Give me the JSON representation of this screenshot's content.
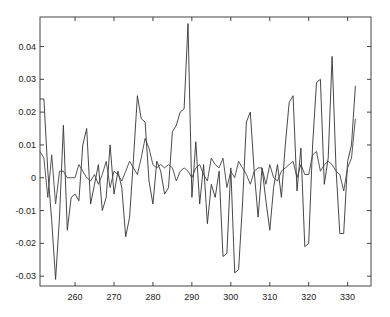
{
  "chart_data": {
    "type": "line",
    "title": "",
    "xlabel": "",
    "ylabel": "",
    "xlim": [
      251,
      336
    ],
    "ylim": [
      -0.033,
      0.049
    ],
    "grid": false,
    "legend": null,
    "x_ticks": [
      260,
      270,
      280,
      290,
      300,
      310,
      320,
      330
    ],
    "x_tick_labels": [
      "260",
      "270",
      "280",
      "290",
      "300",
      "310",
      "320",
      "330"
    ],
    "y_ticks": [
      -0.03,
      -0.02,
      -0.01,
      0,
      0.01,
      0.02,
      0.03,
      0.04
    ],
    "y_tick_labels": [
      "-0.03",
      "-0.02",
      "-0.01",
      "0",
      "0.01",
      "0.02",
      "0.03",
      "0.04"
    ],
    "x": [
      251,
      252,
      253,
      254,
      255,
      256,
      257,
      258,
      259,
      260,
      261,
      262,
      263,
      264,
      265,
      266,
      267,
      268,
      269,
      270,
      271,
      272,
      273,
      274,
      275,
      276,
      277,
      278,
      279,
      280,
      281,
      282,
      283,
      284,
      285,
      286,
      287,
      288,
      289,
      290,
      291,
      292,
      293,
      294,
      295,
      296,
      297,
      298,
      299,
      300,
      301,
      302,
      303,
      304,
      305,
      306,
      307,
      308,
      309,
      310,
      311,
      312,
      313,
      314,
      315,
      316,
      317,
      318,
      319,
      320,
      321,
      322,
      323,
      324,
      325,
      326,
      327,
      328,
      329,
      330,
      331,
      332
    ],
    "series": [
      {
        "name": "series-a",
        "color": "#333333",
        "values": [
          0.024,
          0.024,
          0.002,
          -0.013,
          -0.031,
          -0.012,
          0.016,
          -0.016,
          -0.006,
          -0.005,
          -0.007,
          0.01,
          0.015,
          -0.008,
          -0.002,
          0.004,
          -0.01,
          -0.006,
          0.01,
          -0.005,
          0.002,
          -0.003,
          -0.018,
          -0.012,
          0.006,
          0.025,
          0.018,
          0.017,
          -0.001,
          -0.008,
          0.005,
          0.002,
          -0.005,
          -0.003,
          0.014,
          0.016,
          0.02,
          0.021,
          0.047,
          -0.006,
          0.011,
          -0.008,
          0.004,
          -0.014,
          -0.002,
          -0.006,
          0.002,
          -0.024,
          -0.023,
          0.003,
          -0.029,
          -0.028,
          -0.008,
          0.017,
          0.02,
          0.002,
          -0.012,
          0.003,
          -0.007,
          -0.016,
          -0.003,
          0.004,
          -0.006,
          0.01,
          0.023,
          0.025,
          -0.004,
          0.009,
          -0.021,
          -0.02,
          0.01,
          0.029,
          0.03,
          -0.002,
          0.006,
          0.037,
          0.003,
          -0.017,
          -0.017,
          0.005,
          0.01,
          0.028
        ]
      },
      {
        "name": "series-b",
        "color": "#444444",
        "values": [
          0.008,
          0.006,
          -0.006,
          0.007,
          -0.008,
          0.002,
          0.002,
          0.0,
          0.0,
          0.0,
          0.004,
          0.002,
          0.0,
          -0.001,
          0.001,
          -0.002,
          0.001,
          0.005,
          -0.003,
          0.002,
          0.001,
          -0.001,
          0.002,
          0.005,
          0.003,
          0.001,
          0.006,
          0.012,
          0.009,
          0.004,
          0.003,
          0.004,
          0.003,
          0.004,
          0.003,
          -0.001,
          0.002,
          0.003,
          0.002,
          0.0,
          0.003,
          0.004,
          0.001,
          -0.001,
          0.006,
          0.004,
          0.003,
          0.006,
          -0.003,
          0.002,
          0.0,
          0.005,
          0.003,
          0.001,
          -0.002,
          0.002,
          0.003,
          0.003,
          -0.002,
          0.004,
          0.0,
          -0.001,
          0.002,
          0.003,
          0.004,
          0.005,
          0.0,
          0.004,
          0.001,
          0.001,
          0.007,
          0.008,
          0.002,
          0.004,
          0.005,
          0.004,
          0.002,
          0.001,
          -0.004,
          0.003,
          0.006,
          0.018
        ]
      }
    ]
  },
  "plot_area": {
    "left": 40,
    "right": 371,
    "top": 17,
    "bottom": 286
  }
}
